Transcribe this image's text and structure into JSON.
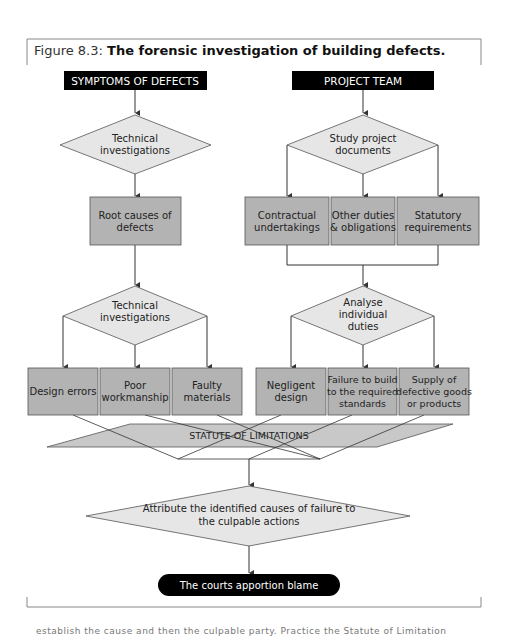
{
  "caption": {
    "number": "Figure 8.3:",
    "title": "The forensic investigation of building defects."
  },
  "left_column": {
    "header": "SYMPTOMS OF DEFECTS",
    "decision1": [
      "Technical",
      "investigations"
    ],
    "process1": [
      "Root causes of",
      "defects"
    ],
    "decision2": [
      "Technical",
      "investigations"
    ],
    "outcomes": [
      {
        "lines": [
          "Design errors"
        ]
      },
      {
        "lines": [
          "Poor",
          "workmanship"
        ]
      },
      {
        "lines": [
          "Faulty",
          "materials"
        ]
      }
    ]
  },
  "right_column": {
    "header": "PROJECT TEAM",
    "decision1": [
      "Study project",
      "documents"
    ],
    "processes": [
      {
        "lines": [
          "Contractual",
          "undertakings"
        ]
      },
      {
        "lines": [
          "Other duties",
          "& obligations"
        ]
      },
      {
        "lines": [
          "Statutory",
          "requirements"
        ]
      }
    ],
    "decision2": [
      "Analyse",
      "individual",
      "duties"
    ],
    "outcomes": [
      {
        "lines": [
          "Negligent",
          "design"
        ]
      },
      {
        "lines": [
          "Failure to build",
          "to the required",
          "standards"
        ]
      },
      {
        "lines": [
          "Supply of",
          "defective goods",
          "or products"
        ]
      }
    ]
  },
  "statute": "STATUTE OF LIMITATIONS",
  "attribute_decision": [
    "Attribute the identified causes of failure to",
    "the culpable actions"
  ],
  "terminal": "The courts apportion blame",
  "colors": {
    "header_fill": "#000000",
    "process_fill": "#b3b3b3",
    "decision_fill": "#e6e6e6",
    "statute_fill": "#c8c8c8",
    "line": "#333333"
  },
  "footer_fragment": "establish the cause and then the culpable party. Practice the Statute of Limitation"
}
